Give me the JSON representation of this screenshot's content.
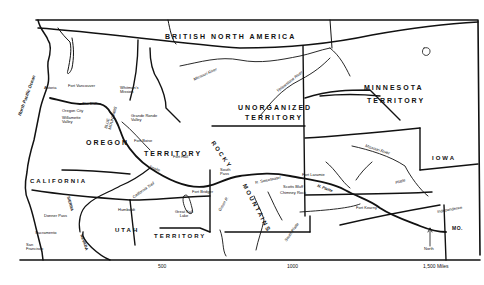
{
  "map": {
    "regions": {
      "british_north_america": "BRITISH   NORTH   AMERICA",
      "minnesota_1": "MINNESOTA",
      "minnesota_2": "TERRITORY",
      "unorganized_1": "UNORGANIZED",
      "unorganized_2": "TERRITORY",
      "oregon_1": "OREGON",
      "oregon_2": "TERRITORY",
      "iowa": "IOWA",
      "california": "CALIFORNIA",
      "utah_1": "UTAH",
      "utah_2": "TERRITORY",
      "rocky": "ROCKY",
      "mountains": "MOUNTAINS",
      "mo": "MO."
    },
    "water": {
      "ocean": "North Pacific Ocean",
      "great_salt_lake": "Great Salt Lake"
    },
    "rivers": {
      "missouri_north": "Missouri River",
      "yellowstone": "Yellowstone River",
      "missouri_east": "Missouri River",
      "platte": "Platte",
      "north_platte": "N. Platte",
      "snake": "Snake",
      "green": "Green R.",
      "south_platte": "South Platte",
      "california_trail": "California Trail",
      "sweetwater": "R. Sweetwater"
    },
    "places": {
      "astoria": "Astoria",
      "fort_vancouver": "Fort Vancouver",
      "whitmans_mission": "Whitman's Mission",
      "oregon_city": "Oregon City",
      "the_dalles": "The Dalles",
      "willamette_valley": "Willamette Valley",
      "blue_mountains": "BLUE MOUNTAINS",
      "grande_ronde": "Grande Ronde Valley",
      "fort_boise": "Fort Boise",
      "fort_hall": "Fort Hall",
      "south_pass": "South Pass",
      "fort_bridger": "Fort Bridger",
      "fort_laramie": "Fort Laramie",
      "scotts_bluff": "Scotts Bluff",
      "chimney_rock": "Chimney Rock",
      "fort_kearny": "Fort Kearny",
      "independence": "Independence",
      "humboldt": "Humboldt",
      "donner_pass": "Donner Pass",
      "sacramento": "Sacramento",
      "san_francisco": "San Francisco",
      "sierra_nevada_1": "SIERRA",
      "sierra_nevada_2": "NEVADA"
    },
    "compass": {
      "label": "North"
    },
    "scale": {
      "ticks": [
        "500",
        "1000",
        "1,500 Miles"
      ]
    }
  }
}
